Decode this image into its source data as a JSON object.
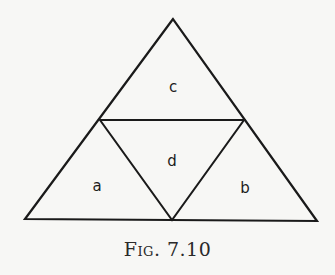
{
  "figure": {
    "caption": "Fig. 7.10",
    "line_color": "#1a1a1a",
    "background": "#f7f7f5",
    "outer_triangle": {
      "apex": [
        173,
        19
      ],
      "left": [
        25,
        219
      ],
      "right": [
        317,
        221
      ]
    },
    "inner_triangle": {
      "left_mid": [
        100,
        120
      ],
      "right_mid": [
        244,
        120
      ],
      "base_mid": [
        172,
        220
      ]
    },
    "regions": [
      {
        "id": "c",
        "label": "c",
        "x": 173,
        "y": 87
      },
      {
        "id": "d",
        "label": "d",
        "x": 172,
        "y": 161
      },
      {
        "id": "a",
        "label": "a",
        "x": 97,
        "y": 186
      },
      {
        "id": "b",
        "label": "b",
        "x": 245,
        "y": 188
      }
    ]
  }
}
